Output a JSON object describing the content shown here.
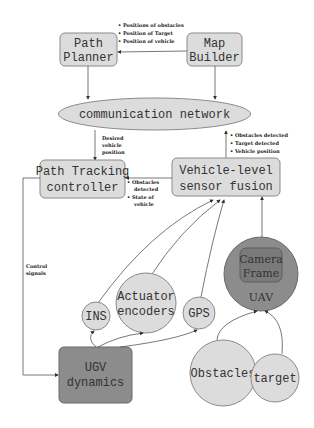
{
  "nodes": {
    "path_planner": {
      "line1": "Path",
      "line2": "Planner"
    },
    "map_builder": {
      "line1": "Map",
      "line2": "Builder"
    },
    "comm_network": {
      "label": "communication network"
    },
    "path_tracking": {
      "line1": "Path Tracking",
      "line2": "controller"
    },
    "sensor_fusion": {
      "line1": "Vehicle-level",
      "line2": "sensor fusion"
    },
    "ins": {
      "label": "INS"
    },
    "actuator": {
      "line1": "Actuator",
      "line2": "encoders"
    },
    "gps": {
      "label": "GPS"
    },
    "uav": {
      "label": "UAV"
    },
    "camera": {
      "line1": "Camera",
      "line2": "Frame"
    },
    "ugv": {
      "line1": "UGV",
      "line2": "dynamics"
    },
    "obstacles": {
      "label": "Obstacles"
    },
    "target": {
      "label": "target"
    }
  },
  "annotations": {
    "map_to_planner": [
      "Positions of obstacles",
      "Position of Target",
      "Position of vehicle"
    ],
    "network_to_tracking": [
      "Desired",
      "vehicle",
      "position"
    ],
    "fusion_to_network": [
      "Obstacles detected",
      "Target detected",
      "Vehicle position"
    ],
    "fusion_to_tracking": [
      "Obstacles",
      "detected",
      "State of",
      "vehicle"
    ],
    "control_signals": [
      "Control",
      "signals"
    ]
  },
  "colors": {
    "box_fill": "#dcdcdc",
    "ugv_fill": "#8c8c8c",
    "uav_fill": "#8a8a8a",
    "camera_fill": "#707070"
  }
}
